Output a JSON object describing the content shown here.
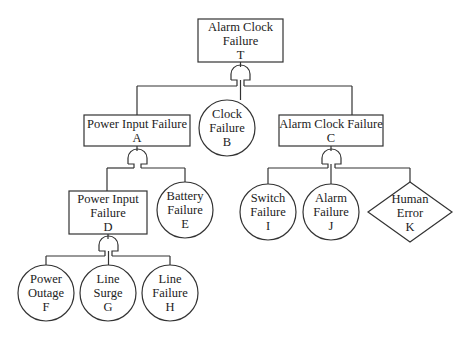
{
  "diagram": {
    "type": "fault-tree",
    "stroke_color": "#333333",
    "background": "#ffffff",
    "nodes": {
      "T": {
        "shape": "rectangle",
        "lines": [
          "Alarm Clock",
          "Failure",
          "T"
        ]
      },
      "A": {
        "shape": "rectangle",
        "lines": [
          "Power Input Failure",
          "A"
        ]
      },
      "B": {
        "shape": "circle",
        "lines": [
          "Clock",
          "Failure",
          "B"
        ]
      },
      "C": {
        "shape": "rectangle",
        "lines": [
          "Alarm Clock Failure",
          "C"
        ]
      },
      "D": {
        "shape": "rectangle",
        "lines": [
          "Power Input",
          "Failure",
          "D"
        ]
      },
      "E": {
        "shape": "circle",
        "lines": [
          "Battery",
          "Failure",
          "E"
        ]
      },
      "F": {
        "shape": "circle",
        "lines": [
          "Power",
          "Outage",
          "F"
        ]
      },
      "G": {
        "shape": "circle",
        "lines": [
          "Line",
          "Surge",
          "G"
        ]
      },
      "H": {
        "shape": "circle",
        "lines": [
          "Line",
          "Failure",
          "H"
        ]
      },
      "I": {
        "shape": "circle",
        "lines": [
          "Switch",
          "Failure",
          "I"
        ]
      },
      "J": {
        "shape": "circle",
        "lines": [
          "Alarm",
          "Failure",
          "J"
        ]
      },
      "K": {
        "shape": "diamond",
        "lines": [
          "Human",
          "Error",
          "K"
        ]
      }
    },
    "gates": [
      {
        "id": "gate-T",
        "type": "OR",
        "parent": "T",
        "children": [
          "A",
          "B",
          "C"
        ]
      },
      {
        "id": "gate-A",
        "type": "OR",
        "parent": "A",
        "children": [
          "D",
          "E"
        ]
      },
      {
        "id": "gate-C",
        "type": "OR",
        "parent": "C",
        "children": [
          "I",
          "J",
          "K"
        ]
      },
      {
        "id": "gate-D",
        "type": "OR",
        "parent": "D",
        "children": [
          "F",
          "G",
          "H"
        ]
      }
    ]
  }
}
